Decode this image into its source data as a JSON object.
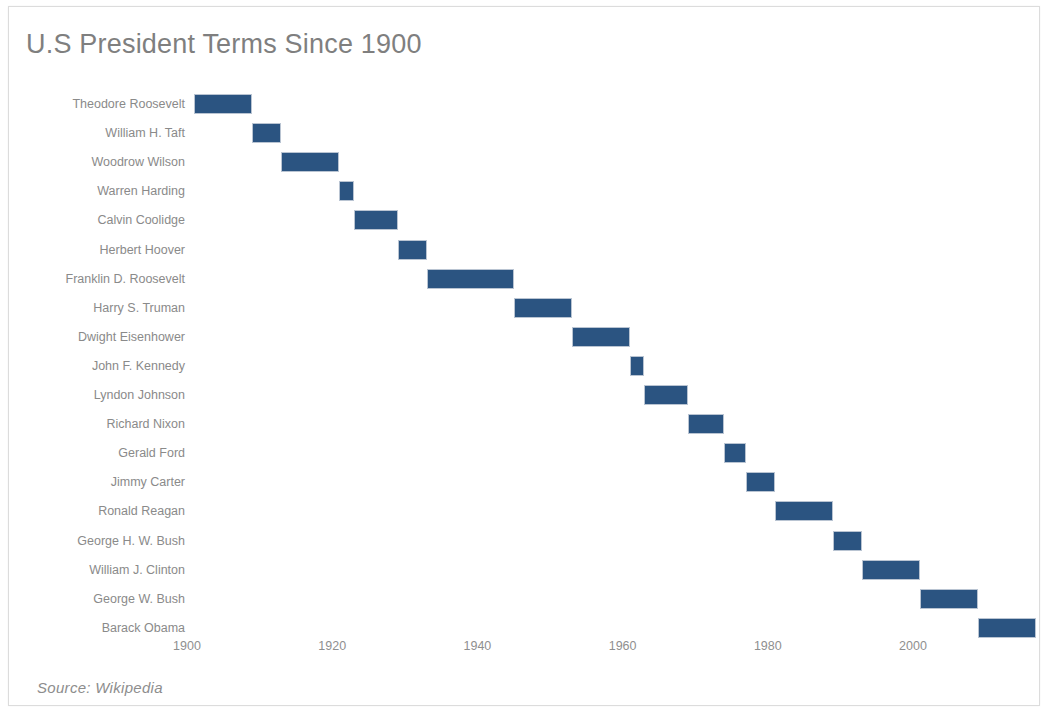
{
  "chart_data": {
    "type": "bar",
    "orientation": "horizontal-timeline",
    "title": "U.S President Terms Since 1900",
    "xlabel": "",
    "ylabel": "",
    "xlim": [
      1900,
      2017
    ],
    "grid": false,
    "legend": false,
    "source": "Source: Wikipedia",
    "bar_color": "#2b5481",
    "title_color": "#7f7f7f",
    "label_color": "#8a8a8a",
    "background": "#ffffff",
    "xticks": [
      1900,
      1920,
      1940,
      1960,
      1980,
      2000
    ],
    "xtick_labels": [
      "1900",
      "1920",
      "1940",
      "1960",
      "1980",
      "2000"
    ],
    "categories": [
      "Theodore Roosevelt",
      "William H. Taft",
      "Woodrow Wilson",
      "Warren Harding",
      "Calvin Coolidge",
      "Herbert Hoover",
      "Franklin D. Roosevelt",
      "Harry S. Truman",
      "Dwight Eisenhower",
      "John F. Kennedy",
      "Lyndon Johnson",
      "Richard Nixon",
      "Gerald Ford",
      "Jimmy Carter",
      "Ronald Reagan",
      "George H. W. Bush",
      "William J. Clinton",
      "George W. Bush",
      "Barack Obama"
    ],
    "bars": [
      {
        "label": "Theodore Roosevelt",
        "start": 1901,
        "end": 1909
      },
      {
        "label": "William H. Taft",
        "start": 1909,
        "end": 1913
      },
      {
        "label": "Woodrow Wilson",
        "start": 1913,
        "end": 1921
      },
      {
        "label": "Warren Harding",
        "start": 1921,
        "end": 1923
      },
      {
        "label": "Calvin Coolidge",
        "start": 1923,
        "end": 1929
      },
      {
        "label": "Herbert Hoover",
        "start": 1929,
        "end": 1933
      },
      {
        "label": "Franklin D. Roosevelt",
        "start": 1933,
        "end": 1945
      },
      {
        "label": "Harry S. Truman",
        "start": 1945,
        "end": 1953
      },
      {
        "label": "Dwight Eisenhower",
        "start": 1953,
        "end": 1961
      },
      {
        "label": "John F. Kennedy",
        "start": 1961,
        "end": 1963
      },
      {
        "label": "Lyndon Johnson",
        "start": 1963,
        "end": 1969
      },
      {
        "label": "Richard Nixon",
        "start": 1969,
        "end": 1974
      },
      {
        "label": "Gerald Ford",
        "start": 1974,
        "end": 1977
      },
      {
        "label": "Jimmy Carter",
        "start": 1977,
        "end": 1981
      },
      {
        "label": "Ronald Reagan",
        "start": 1981,
        "end": 1989
      },
      {
        "label": "George H. W. Bush",
        "start": 1989,
        "end": 1993
      },
      {
        "label": "William J. Clinton",
        "start": 1993,
        "end": 2001
      },
      {
        "label": "George W. Bush",
        "start": 2001,
        "end": 2009
      },
      {
        "label": "Barack Obama",
        "start": 2009,
        "end": 2017
      }
    ]
  },
  "layout": {
    "origin_x": 178,
    "px_per_year": 7.26,
    "first_row_y": 87,
    "row_step": 29.1
  }
}
